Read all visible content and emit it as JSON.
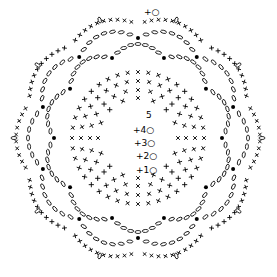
{
  "diagram": {
    "type": "crochet-chart",
    "center": [
      138,
      138
    ],
    "ink": "#000000",
    "background": "#ffffff",
    "row_labels": [
      {
        "text": "+1○",
        "x": 136,
        "y": 174
      },
      {
        "text": "+2○",
        "x": 136,
        "y": 160
      },
      {
        "text": "+3○",
        "x": 134,
        "y": 147
      },
      {
        "text": "+4○",
        "x": 133,
        "y": 134
      },
      {
        "text": "5",
        "x": 146,
        "y": 119
      },
      {
        "text": "+○",
        "x": 144,
        "y": 16
      }
    ],
    "rows": [
      {
        "name": "round-1",
        "symbol": "single-crochet",
        "radius": 40,
        "count": 16
      },
      {
        "name": "round-2",
        "symbol": "single-crochet",
        "radius": 48,
        "count": 24
      },
      {
        "name": "round-3",
        "symbol": "single-crochet",
        "radius": 57,
        "count": 32
      },
      {
        "name": "round-4",
        "symbol": "single-crochet",
        "radius": 66,
        "count": 40
      },
      {
        "name": "round-5",
        "symbol": "chain-scallops",
        "radius": 84,
        "count": 10
      },
      {
        "name": "round-6",
        "symbol": "chain-scallops",
        "radius": 100,
        "count": 10
      },
      {
        "name": "round-7",
        "symbol": "sc-border",
        "radius": 118,
        "count": 10
      }
    ]
  }
}
